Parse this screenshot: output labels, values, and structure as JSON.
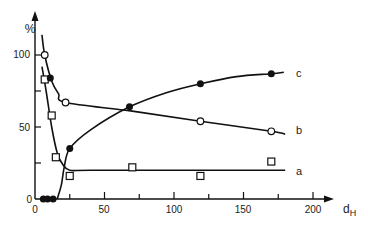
{
  "chart_data": {
    "type": "line",
    "title": "",
    "xlabel": "dH",
    "ylabel": "%",
    "xlim": [
      0,
      210
    ],
    "ylim": [
      0,
      110
    ],
    "x_ticks": [
      0,
      50,
      100,
      150,
      200
    ],
    "x_minor_ticks": [
      25,
      75,
      125,
      175
    ],
    "y_ticks": [
      0,
      50,
      100
    ],
    "y_minor_ticks": [
      25,
      75
    ],
    "grid": false,
    "legend": "curve-end labels",
    "series": [
      {
        "name": "a",
        "marker": "open-square",
        "points": [
          [
            7,
            83
          ],
          [
            12,
            58
          ],
          [
            15,
            29
          ],
          [
            25,
            16
          ],
          [
            70,
            22
          ],
          [
            119,
            16
          ],
          [
            170,
            26
          ]
        ],
        "curve": [
          [
            5,
            92
          ],
          [
            8,
            75
          ],
          [
            12,
            50
          ],
          [
            16,
            32
          ],
          [
            20,
            24
          ],
          [
            25,
            20
          ],
          [
            40,
            20
          ],
          [
            100,
            20
          ],
          [
            180,
            20
          ]
        ]
      },
      {
        "name": "b",
        "marker": "open-circle",
        "points": [
          [
            7,
            100
          ],
          [
            22,
            67
          ],
          [
            119,
            54
          ],
          [
            170,
            47
          ]
        ],
        "curve": [
          [
            5,
            114
          ],
          [
            7,
            100
          ],
          [
            12,
            82
          ],
          [
            17,
            73
          ],
          [
            22,
            67
          ],
          [
            70,
            61
          ],
          [
            119,
            54
          ],
          [
            170,
            47
          ],
          [
            180,
            45
          ]
        ]
      },
      {
        "name": "c",
        "marker": "filled-circle",
        "points": [
          [
            6,
            0
          ],
          [
            9,
            0
          ],
          [
            13,
            0
          ],
          [
            11,
            84
          ],
          [
            25,
            35
          ],
          [
            68,
            64
          ],
          [
            119,
            80
          ],
          [
            170,
            87
          ]
        ],
        "curve": [
          [
            16,
            0
          ],
          [
            19,
            10
          ],
          [
            21,
            22
          ],
          [
            25,
            35
          ],
          [
            40,
            48
          ],
          [
            68,
            64
          ],
          [
            95,
            74
          ],
          [
            119,
            80
          ],
          [
            145,
            85
          ],
          [
            170,
            87
          ],
          [
            179,
            88
          ]
        ]
      }
    ]
  },
  "labels": {
    "y_unit": "%",
    "x_name": "d",
    "x_sub": "H",
    "series_a": "a",
    "series_b": "b",
    "series_c": "c",
    "tick_x_0": "0",
    "tick_x_50": "50",
    "tick_x_100": "100",
    "tick_x_150": "150",
    "tick_x_200": "200",
    "tick_y_0": "0",
    "tick_y_50": "50",
    "tick_y_100": "100"
  }
}
